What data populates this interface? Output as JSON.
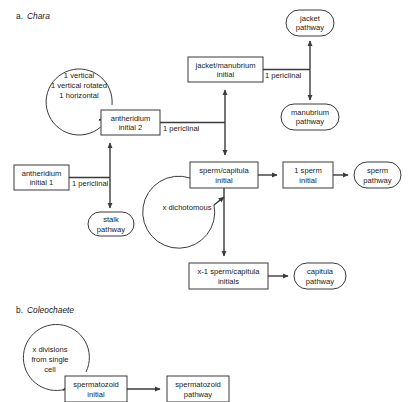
{
  "figure": {
    "background": "#ffffff",
    "stroke_color": "#3a3a3a",
    "text_color": "#1a1a1a"
  },
  "sections": {
    "a": {
      "marker": "a.",
      "organism": "Chara"
    },
    "b": {
      "marker": "b.",
      "organism": "Coleochaete"
    }
  },
  "nodes": {
    "antheridium_initial_1": {
      "label_line1": "antheridium",
      "label_line2": "initial 1",
      "shape": "rect"
    },
    "antheridium_initial_2": {
      "label_line1": "antheridium",
      "label_line2": "initial 2",
      "shape": "rect"
    },
    "jacket_manubrium_initial": {
      "label_line1": "jacket/manubrium",
      "label_line2": "initial",
      "shape": "rect"
    },
    "sperm_capitula_initial": {
      "label_line1": "sperm/capitula",
      "label_line2": "initial",
      "shape": "rect"
    },
    "one_sperm_initial": {
      "label_line1": "1 sperm",
      "label_line2": "initial",
      "shape": "rect"
    },
    "x_minus_1_sperm_capitula_initials": {
      "label_line1": "x-1 sperm/capitula",
      "label_line2": "initials",
      "shape": "rect"
    },
    "jacket_pathway": {
      "label_line1": "jacket",
      "label_line2": "pathway",
      "shape": "stadium"
    },
    "manubrium_pathway": {
      "label_line1": "manubrium",
      "label_line2": "pathway",
      "shape": "stadium"
    },
    "stalk_pathway": {
      "label_line1": "stalk",
      "label_line2": "pathway",
      "shape": "stadium"
    },
    "sperm_pathway": {
      "label_line1": "sperm",
      "label_line2": "pathway",
      "shape": "stadium"
    },
    "capitula_pathway": {
      "label_line1": "capitula",
      "label_line2": "pathway",
      "shape": "stadium"
    },
    "spermatozoid_initial": {
      "label_line1": "spermatozoid",
      "label_line2": "initial",
      "shape": "rect"
    },
    "spermatozoid_pathway": {
      "label_line1": "spermatozoid",
      "label_line2": "pathway",
      "shape": "rect"
    }
  },
  "loops": {
    "division_loop_chara": {
      "label_line1": "1 vertical",
      "label_line2": "1 vertical rotated",
      "label_line3": "1 horizontal"
    },
    "dichotomous_loop": {
      "label": "x dichotomous"
    },
    "division_loop_coleochaete": {
      "label_line1": "x divisions",
      "label_line2": "from single",
      "label_line3": "cell"
    }
  },
  "edges": {
    "ai1_to_ai2": {
      "label": "1 periclinal"
    },
    "ai2_to_branch": {
      "label": "1 periclinal"
    },
    "jm_to_branch": {
      "label": "1 periclinal"
    }
  }
}
